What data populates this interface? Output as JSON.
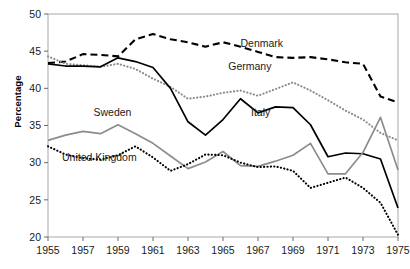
{
  "chart_data": {
    "type": "line",
    "title": "",
    "xlabel": "",
    "ylabel": "Percentage",
    "x": [
      1955,
      1956,
      1957,
      1958,
      1959,
      1960,
      1961,
      1962,
      1963,
      1964,
      1965,
      1966,
      1967,
      1968,
      1969,
      1970,
      1971,
      1972,
      1973,
      1974,
      1975
    ],
    "xlim": [
      1955,
      1975
    ],
    "ylim": [
      20,
      50
    ],
    "xticks": [
      "1955",
      "1957",
      "1959",
      "1961",
      "1963",
      "1965",
      "1967",
      "1969",
      "1971",
      "1973",
      "1975"
    ],
    "xtick_values": [
      1955,
      1957,
      1959,
      1961,
      1963,
      1965,
      1967,
      1969,
      1971,
      1973,
      1975
    ],
    "yticks": [
      "20",
      "25",
      "30",
      "35",
      "40",
      "45",
      "50"
    ],
    "ytick_values": [
      20,
      25,
      30,
      35,
      40,
      45,
      50
    ],
    "grid": false,
    "legend_position": "inline-annotations",
    "series": [
      {
        "name": "Denmark",
        "color": "#000000",
        "style": "dashed",
        "label_x": 1966.0,
        "label_y": 45.6,
        "values": [
          43.4,
          43.6,
          44.6,
          44.5,
          44.3,
          46.6,
          47.3,
          46.6,
          46.2,
          45.6,
          46.2,
          45.6,
          44.9,
          44.2,
          44.1,
          44.2,
          43.9,
          43.5,
          43.3,
          38.9,
          38.1
        ]
      },
      {
        "name": "Germany",
        "color": "#8c8c8c",
        "style": "dotted",
        "label_x": 1965.3,
        "label_y": 42.4,
        "values": [
          44.3,
          43.3,
          43.1,
          42.9,
          43.3,
          42.6,
          41.3,
          40.2,
          38.6,
          38.9,
          39.4,
          39.7,
          39.0,
          39.9,
          40.8,
          39.7,
          38.4,
          37.0,
          35.8,
          34.0,
          33.0
        ]
      },
      {
        "name": "Italy",
        "color": "#000000",
        "style": "solid",
        "label_x": 1966.6,
        "label_y": 36.3,
        "values": [
          43.3,
          43.0,
          43.0,
          42.9,
          44.1,
          43.6,
          42.8,
          40.0,
          35.5,
          33.7,
          35.8,
          38.6,
          36.7,
          37.5,
          37.4,
          35.1,
          30.8,
          31.3,
          31.2,
          30.5,
          23.9
        ]
      },
      {
        "name": "Sweden",
        "color": "#8c8c8c",
        "style": "solid",
        "label_x": 1957.6,
        "label_y": 36.3,
        "values": [
          33.0,
          33.7,
          34.2,
          33.9,
          35.1,
          33.9,
          32.6,
          30.9,
          29.2,
          30.1,
          31.5,
          29.6,
          29.5,
          30.2,
          31.0,
          32.6,
          28.5,
          28.5,
          31.4,
          36.1,
          29.0
        ]
      },
      {
        "name": "United Kingdom",
        "color": "#000000",
        "style": "dotted",
        "label_x": 1955.8,
        "label_y": 30.2,
        "values": [
          32.2,
          31.1,
          30.6,
          30.4,
          31.0,
          32.2,
          30.7,
          28.9,
          29.8,
          31.1,
          31.0,
          30.0,
          29.4,
          29.5,
          28.9,
          26.6,
          27.3,
          28.0,
          26.6,
          24.6,
          20.3
        ]
      }
    ]
  },
  "axes": {
    "ylabel_text": "Percentage"
  }
}
